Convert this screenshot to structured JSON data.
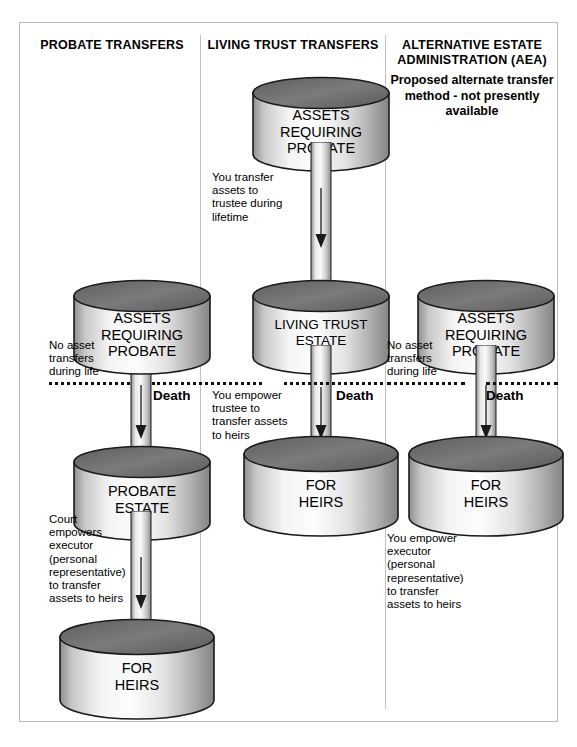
{
  "diagram": {
    "columns": [
      {
        "id": "probate-transfers",
        "title": "PROBATE\nTRANSFERS",
        "subtitle": "",
        "nodes": [
          {
            "id": "assets-requiring-probate",
            "label": "ASSETS\nREQUIRING\nPROBATE"
          },
          {
            "id": "probate-estate",
            "label": "PROBATE\nESTATE"
          },
          {
            "id": "for-heirs",
            "label": "FOR\nHEIRS"
          }
        ],
        "annotations": [
          {
            "id": "no-asset-transfers",
            "text": "No asset\ntransfers\nduring life"
          },
          {
            "id": "court-empowers-executor",
            "text": "Court\nempowers\nexecutor\n(personal\nrepresentative)\nto transfer\nassets to heirs"
          }
        ]
      },
      {
        "id": "living-trust-transfers",
        "title": "LIVING TRUST\nTRANSFERS",
        "subtitle": "",
        "nodes": [
          {
            "id": "assets-requiring-probate",
            "label": "ASSETS\nREQUIRING\nPROBATE"
          },
          {
            "id": "living-trust-estate",
            "label": "LIVING TRUST\nESTATE"
          },
          {
            "id": "for-heirs",
            "label": "FOR\nHEIRS"
          }
        ],
        "annotations": [
          {
            "id": "you-transfer-assets",
            "text": "You transfer\nassets to\ntrustee during\nlifetime"
          },
          {
            "id": "you-empower-trustee",
            "text": "You empower\ntrustee to\ntransfer assets\nto heirs"
          }
        ]
      },
      {
        "id": "alternative-estate-administration",
        "title": "ALTERNATIVE ESTATE\nADMINISTRATION (AEA)",
        "subtitle": "Proposed alternate\ntransfer method - not\npresently available",
        "nodes": [
          {
            "id": "assets-requiring-probate",
            "label": "ASSETS\nREQUIRING\nPROBATE"
          },
          {
            "id": "for-heirs",
            "label": "FOR\nHEIRS"
          }
        ],
        "annotations": [
          {
            "id": "no-asset-transfers",
            "text": "No asset\ntransfers\nduring life"
          },
          {
            "id": "you-empower-executor",
            "text": "You empower\nexecutor\n(personal\nrepresentative)\nto transfer\nassets to heirs"
          }
        ]
      }
    ],
    "death_line": {
      "label": "Death",
      "labels": [
        "Death",
        "Death",
        "Death"
      ]
    },
    "colors": {
      "cylinder_top": "#6f6f6f",
      "cylinder_body_light": "#f2f2f2",
      "cylinder_body_dark": "#9a9a9a",
      "outline": "#1a1a1a",
      "frame_border": "#b9b9b9",
      "divider": "#c2c2c2",
      "text": "#000000",
      "background": "#ffffff"
    }
  }
}
